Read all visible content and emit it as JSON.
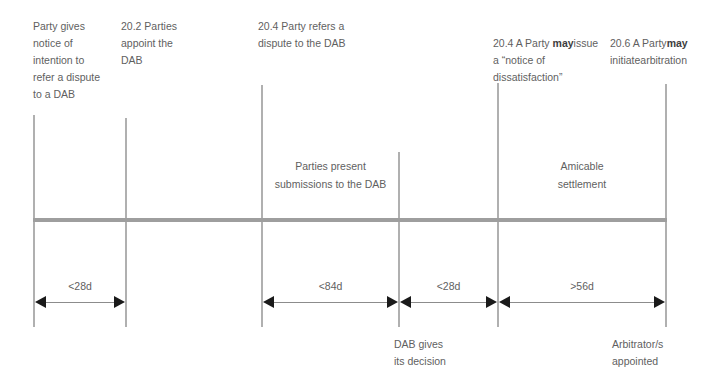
{
  "diagram": {
    "accent_color": "#9e9e9e",
    "line_color": "#b0b0b0",
    "text_color": "#5f5f5f",
    "arrow_color": "#1a1a1a"
  },
  "milestones": [
    {
      "id": "m1",
      "text": "Party gives\nnotice of\nintention to\nrefer a dispute\nto a DAB",
      "x": 33
    },
    {
      "id": "m2",
      "text": "20.2 Parties\nappoint the\nDAB",
      "x": 125
    },
    {
      "id": "m3",
      "text": "20.4 Party refers a\ndispute to the DAB",
      "x": 261
    },
    {
      "id": "m4",
      "text": "",
      "x": 398
    },
    {
      "id": "m5_prefix",
      "text": "20.4 A Party ",
      "bold": "may",
      "suffix": "\nissue a “notice of\ndissatisfaction”",
      "x": 497
    },
    {
      "id": "m6_prefix",
      "text": "20.6 A Party\n",
      "bold": "may",
      "suffix": " initiate\narbitration",
      "x": 665
    }
  ],
  "top_labels": {
    "l1": "Party gives\nnotice of\nintention to\nrefer a dispute\nto a DAB",
    "l2": "20.2 Parties\nappoint the\nDAB",
    "l3": "20.4 Party refers a\ndispute to the DAB",
    "l4_line1_pre": "20.4 A Party ",
    "l4_line1_bold": "may",
    "l4_rest": "issue a “notice of\ndissatisfaction”",
    "l5_line1": "20.6 A Party",
    "l5_line2_bold": "may",
    "l5_line2_rest": " initiate",
    "l5_line3": "arbitration"
  },
  "phase_labels": {
    "submissions": "Parties present\nsubmissions to the DAB",
    "amicable": "Amicable\nsettlement"
  },
  "durations": [
    {
      "id": "d1",
      "label": "<28d",
      "from_x": 33,
      "to_x": 125
    },
    {
      "id": "d2",
      "label": "<84d",
      "from_x": 261,
      "to_x": 398
    },
    {
      "id": "d3",
      "label": "<28d",
      "from_x": 398,
      "to_x": 497
    },
    {
      "id": "d4",
      "label": ">56d",
      "from_x": 497,
      "to_x": 665
    }
  ],
  "bottom_labels": {
    "dab_decision": "DAB gives\nits decision",
    "arbitrators": "Arbitrator/s\nappointed"
  }
}
